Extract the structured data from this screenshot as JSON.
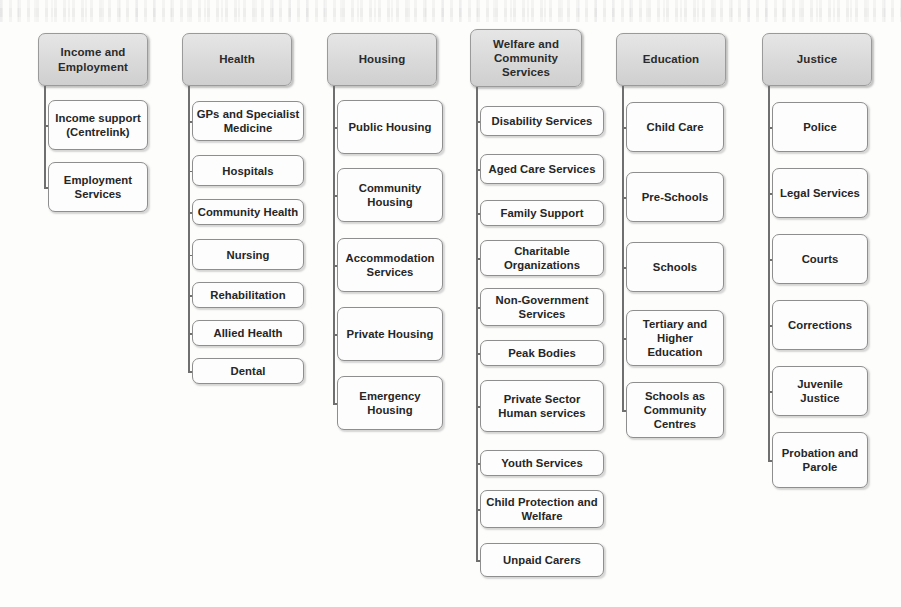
{
  "diagram": {
    "type": "tree",
    "orientation": "top-down-columns",
    "colors": {
      "page_background": "#fdfdfc",
      "header_fill_top": "#e6e6e6",
      "header_fill_bottom": "#cfcfcf",
      "header_border": "#9a9a9a",
      "child_fill": "#fdfdfd",
      "child_border": "#8e8e8e",
      "connector": "#6f6f6f",
      "text": "#262626"
    },
    "columns": [
      {
        "id": "income-and-employment",
        "header": "Income and Employment",
        "x": 38,
        "head_y": 33,
        "head_w": 110,
        "head_h": 53,
        "trunk_x": 44,
        "child_x": 48,
        "child_w": 100,
        "children": [
          {
            "label": "Income support (Centrelink)",
            "y": 100,
            "h": 50
          },
          {
            "label": "Employment Services",
            "y": 162,
            "h": 50
          }
        ]
      },
      {
        "id": "health",
        "header": "Health",
        "x": 182,
        "head_y": 33,
        "head_w": 110,
        "head_h": 53,
        "trunk_x": 188,
        "child_x": 192,
        "child_w": 112,
        "children": [
          {
            "label": "GPs and Specialist Medicine",
            "y": 101,
            "h": 40
          },
          {
            "label": "Hospitals",
            "y": 155,
            "h": 31
          },
          {
            "label": "Community Health",
            "y": 199,
            "h": 26
          },
          {
            "label": "Nursing",
            "y": 239,
            "h": 31
          },
          {
            "label": "Rehabilitation",
            "y": 282,
            "h": 26
          },
          {
            "label": "Allied Health",
            "y": 320,
            "h": 26
          },
          {
            "label": "Dental",
            "y": 358,
            "h": 26
          }
        ]
      },
      {
        "id": "housing",
        "header": "Housing",
        "x": 327,
        "head_y": 33,
        "head_w": 110,
        "head_h": 53,
        "trunk_x": 333,
        "child_x": 337,
        "child_w": 106,
        "children": [
          {
            "label": "Public Housing",
            "y": 100,
            "h": 54
          },
          {
            "label": "Community Housing",
            "y": 168,
            "h": 54
          },
          {
            "label": "Accommodation Services",
            "y": 238,
            "h": 54
          },
          {
            "label": "Private Housing",
            "y": 307,
            "h": 54
          },
          {
            "label": "Emergency Housing",
            "y": 376,
            "h": 54
          }
        ]
      },
      {
        "id": "welfare-and-community-services",
        "header": "Welfare and Community Services",
        "x": 470,
        "head_y": 29,
        "head_w": 112,
        "head_h": 58,
        "trunk_x": 476,
        "child_x": 480,
        "child_w": 124,
        "children": [
          {
            "label": "Disability Services",
            "y": 106,
            "h": 30
          },
          {
            "label": "Aged Care Services",
            "y": 154,
            "h": 30
          },
          {
            "label": "Family Support",
            "y": 200,
            "h": 26
          },
          {
            "label": "Charitable Organizations",
            "y": 240,
            "h": 36
          },
          {
            "label": "Non-Government Services",
            "y": 288,
            "h": 38
          },
          {
            "label": "Peak Bodies",
            "y": 340,
            "h": 26
          },
          {
            "label": "Private Sector Human services",
            "y": 380,
            "h": 52
          },
          {
            "label": "Youth Services",
            "y": 450,
            "h": 26
          },
          {
            "label": "Child Protection and Welfare",
            "y": 490,
            "h": 38
          },
          {
            "label": "Unpaid Carers",
            "y": 543,
            "h": 34
          }
        ]
      },
      {
        "id": "education",
        "header": "Education",
        "x": 616,
        "head_y": 33,
        "head_w": 110,
        "head_h": 53,
        "trunk_x": 622,
        "child_x": 626,
        "child_w": 98,
        "children": [
          {
            "label": "Child Care",
            "y": 102,
            "h": 50
          },
          {
            "label": "Pre-Schools",
            "y": 172,
            "h": 50
          },
          {
            "label": "Schools",
            "y": 242,
            "h": 50
          },
          {
            "label": "Tertiary and Higher Education",
            "y": 310,
            "h": 56
          },
          {
            "label": "Schools as Community Centres",
            "y": 382,
            "h": 56
          }
        ]
      },
      {
        "id": "justice",
        "header": "Justice",
        "x": 762,
        "head_y": 33,
        "head_w": 110,
        "head_h": 53,
        "trunk_x": 768,
        "child_x": 772,
        "child_w": 96,
        "children": [
          {
            "label": "Police",
            "y": 102,
            "h": 50
          },
          {
            "label": "Legal Services",
            "y": 168,
            "h": 50
          },
          {
            "label": "Courts",
            "y": 234,
            "h": 50
          },
          {
            "label": "Corrections",
            "y": 300,
            "h": 50
          },
          {
            "label": "Juvenile Justice",
            "y": 366,
            "h": 50
          },
          {
            "label": "Probation and Parole",
            "y": 432,
            "h": 56
          }
        ]
      }
    ]
  }
}
